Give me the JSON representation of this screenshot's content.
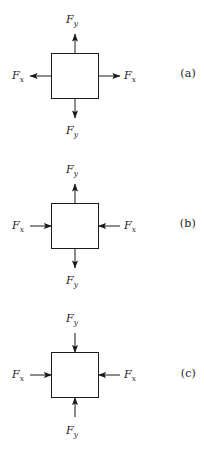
{
  "figure": {
    "title": "",
    "panels": [
      {
        "id": "a",
        "caption": "(a)",
        "loading_state": "biaxial tension",
        "forces": [
          {
            "name": "top",
            "label": "F",
            "subscript": "y",
            "direction": "up",
            "sense": "outward"
          },
          {
            "name": "bottom",
            "label": "F",
            "subscript": "y",
            "direction": "down",
            "sense": "outward"
          },
          {
            "name": "left",
            "label": "F",
            "subscript": "x",
            "direction": "left",
            "sense": "outward"
          },
          {
            "name": "right",
            "label": "F",
            "subscript": "x",
            "direction": "right",
            "sense": "outward"
          }
        ]
      },
      {
        "id": "b",
        "caption": "(b)",
        "loading_state": "vertical tension with horizontal compression",
        "forces": [
          {
            "name": "top",
            "label": "F",
            "subscript": "y",
            "direction": "up",
            "sense": "outward"
          },
          {
            "name": "bottom",
            "label": "F",
            "subscript": "y",
            "direction": "down",
            "sense": "outward"
          },
          {
            "name": "left",
            "label": "F",
            "subscript": "x",
            "direction": "right",
            "sense": "inward"
          },
          {
            "name": "right",
            "label": "F",
            "subscript": "x",
            "direction": "left",
            "sense": "inward"
          }
        ]
      },
      {
        "id": "c",
        "caption": "(c)",
        "loading_state": "biaxial compression",
        "forces": [
          {
            "name": "top",
            "label": "F",
            "subscript": "y",
            "direction": "down",
            "sense": "inward"
          },
          {
            "name": "bottom",
            "label": "F",
            "subscript": "y",
            "direction": "up",
            "sense": "inward"
          },
          {
            "name": "left",
            "label": "F",
            "subscript": "x",
            "direction": "right",
            "sense": "inward"
          },
          {
            "name": "right",
            "label": "F",
            "subscript": "x",
            "direction": "left",
            "sense": "inward"
          }
        ]
      }
    ],
    "colors": {
      "stroke": "#1a1a1a",
      "fill": "#ffffff",
      "background": "#ffffff"
    }
  }
}
